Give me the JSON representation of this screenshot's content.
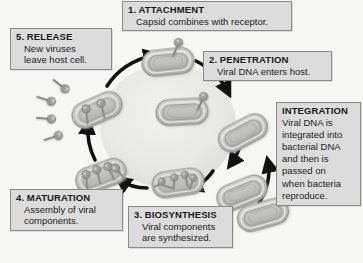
{
  "diagram": {
    "background_color": "#f7f7f5",
    "box_fill": "#dcdcdc",
    "box_border": "#8a8a8a",
    "arrow_color": "#111111",
    "cell_color": "#b9b9b9",
    "circle_shade": "#ececea"
  },
  "steps": {
    "attachment": {
      "heading": "1. ATTACHMENT",
      "lines": [
        "Capsid combines with receptor."
      ]
    },
    "penetration": {
      "heading": "2. PENETRATION",
      "lines": [
        "Viral DNA enters host."
      ]
    },
    "biosynthesis": {
      "heading": "3. BIOSYNTHESIS",
      "lines": [
        "Viral components",
        "are synthesized."
      ]
    },
    "maturation": {
      "heading": "4. MATURATION",
      "lines": [
        "Assembly of viral",
        "components."
      ]
    },
    "release": {
      "heading": "5. RELEASE",
      "lines": [
        "New viruses",
        "leave host cell."
      ]
    },
    "integration": {
      "heading": "INTEGRATION",
      "lines": [
        "Viral DNA is",
        "integrated into",
        "bacterial DNA",
        "and then is",
        "passed on",
        "when bacteria",
        "reproduce."
      ]
    }
  },
  "figure_elements": {
    "bacterial_cells": 7,
    "free_viruses_released": 4,
    "cycle_direction": "clockwise"
  }
}
